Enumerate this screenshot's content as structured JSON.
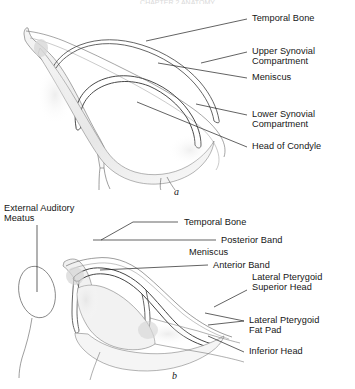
{
  "figure": {
    "title_fragment": "CHAPTER 2 ANATOMY",
    "background_color": "#ffffff",
    "line_color": "#444444",
    "shade_color": "#e9e9e9",
    "text_color": "#161616"
  },
  "panels": [
    {
      "letter": "a",
      "caption": "a"
    },
    {
      "letter": "b",
      "caption": "b"
    }
  ],
  "panel_a": {
    "letter": "a",
    "labels": [
      {
        "id": "temporal-bone",
        "text": "Temporal Bone"
      },
      {
        "id": "upper-synovial-line1",
        "text": "Upper Synovial"
      },
      {
        "id": "upper-synovial-line2",
        "text": "Compartment"
      },
      {
        "id": "meniscus",
        "text": "Meniscus"
      },
      {
        "id": "lower-synovial-line1",
        "text": "Lower Synovial"
      },
      {
        "id": "lower-synovial-line2",
        "text": "Compartment"
      },
      {
        "id": "head-of-condyle",
        "text": "Head of Condyle"
      }
    ]
  },
  "panel_b": {
    "letter": "b",
    "labels": [
      {
        "id": "external-auditory-line1",
        "text": "External Auditory"
      },
      {
        "id": "external-auditory-line2",
        "text": "Meatus"
      },
      {
        "id": "temporal-bone",
        "text": "Temporal Bone"
      },
      {
        "id": "posterior-band",
        "text": "Posterior Band"
      },
      {
        "id": "meniscus",
        "text": "Meniscus"
      },
      {
        "id": "anterior-band",
        "text": "Anterior Band"
      },
      {
        "id": "lateral-pterygoid-sup-1",
        "text": "Lateral Pterygoid"
      },
      {
        "id": "lateral-pterygoid-sup-2",
        "text": "Superior Head"
      },
      {
        "id": "lateral-pterygoid-fat-1",
        "text": "Lateral Pterygoid"
      },
      {
        "id": "lateral-pterygoid-fat-2",
        "text": "Fat Pad"
      },
      {
        "id": "inferior-head",
        "text": "Inferior Head"
      }
    ]
  }
}
